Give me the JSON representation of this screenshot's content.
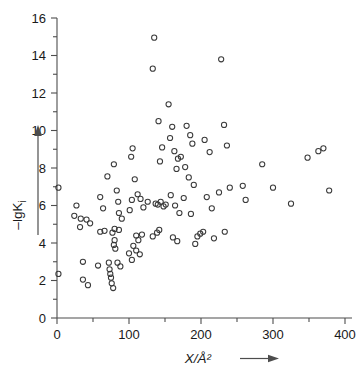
{
  "chart_data": {
    "type": "scatter",
    "title": "",
    "xlabel": "X/Å²",
    "ylabel": "–lgK",
    "ylabel_sub": "i",
    "xlim": [
      0,
      400
    ],
    "ylim": [
      0,
      16
    ],
    "grid": false,
    "legend": null,
    "x_ticks": [
      0,
      100,
      200,
      300,
      400
    ],
    "x_tick_labels": [
      "0",
      "100",
      "200",
      "300",
      "400"
    ],
    "x_minor_step": 50,
    "y_ticks": [
      0,
      2,
      4,
      6,
      8,
      10,
      12,
      14,
      16
    ],
    "y_tick_labels": [
      "0",
      "2",
      "4",
      "6",
      "8",
      "10",
      "12",
      "14",
      "16"
    ],
    "y_minor_step": 1,
    "marker": "open-circle",
    "marker_size_px": 5.2,
    "marker_color": "#3a3a3a",
    "points": [
      [
        2,
        6.95
      ],
      [
        2,
        2.35
      ],
      [
        27,
        6.0
      ],
      [
        24,
        5.45
      ],
      [
        33,
        5.3
      ],
      [
        32,
        4.85
      ],
      [
        41,
        5.25
      ],
      [
        46,
        5.05
      ],
      [
        36,
        3.0
      ],
      [
        36,
        2.05
      ],
      [
        43,
        1.75
      ],
      [
        60,
        6.45
      ],
      [
        64,
        5.85
      ],
      [
        70,
        7.55
      ],
      [
        60,
        4.6
      ],
      [
        66,
        4.65
      ],
      [
        57,
        2.8
      ],
      [
        72,
        2.95
      ],
      [
        73,
        2.6
      ],
      [
        74,
        2.35
      ],
      [
        75,
        2.15
      ],
      [
        76,
        1.85
      ],
      [
        78,
        1.6
      ],
      [
        79,
        8.2
      ],
      [
        83,
        6.8
      ],
      [
        85,
        6.2
      ],
      [
        86,
        5.6
      ],
      [
        90,
        5.3
      ],
      [
        80,
        4.75
      ],
      [
        86,
        4.7
      ],
      [
        77,
        4.55
      ],
      [
        80,
        4.15
      ],
      [
        79,
        3.9
      ],
      [
        81,
        3.7
      ],
      [
        84,
        2.95
      ],
      [
        88,
        2.75
      ],
      [
        105,
        9.05
      ],
      [
        103,
        8.6
      ],
      [
        108,
        7.4
      ],
      [
        104,
        6.3
      ],
      [
        101,
        5.75
      ],
      [
        112,
        6.6
      ],
      [
        116,
        6.35
      ],
      [
        120,
        5.9
      ],
      [
        126,
        6.2
      ],
      [
        110,
        4.4
      ],
      [
        113,
        4.15
      ],
      [
        118,
        4.45
      ],
      [
        106,
        3.85
      ],
      [
        110,
        3.6
      ],
      [
        100,
        3.45
      ],
      [
        104,
        3.1
      ],
      [
        115,
        3.4
      ],
      [
        135,
        14.95
      ],
      [
        133,
        13.3
      ],
      [
        141,
        10.5
      ],
      [
        146,
        9.1
      ],
      [
        143,
        8.35
      ],
      [
        137,
        6.1
      ],
      [
        140,
        6.05
      ],
      [
        144,
        6.2
      ],
      [
        148,
        5.95
      ],
      [
        151,
        6.05
      ],
      [
        133,
        4.35
      ],
      [
        139,
        4.55
      ],
      [
        142,
        4.7
      ],
      [
        155,
        11.4
      ],
      [
        160,
        10.2
      ],
      [
        157,
        9.6
      ],
      [
        163,
        8.9
      ],
      [
        168,
        8.5
      ],
      [
        166,
        7.95
      ],
      [
        172,
        8.6
      ],
      [
        158,
        6.55
      ],
      [
        164,
        6.0
      ],
      [
        170,
        5.6
      ],
      [
        161,
        4.3
      ],
      [
        167,
        4.1
      ],
      [
        180,
        10.25
      ],
      [
        185,
        9.75
      ],
      [
        188,
        9.3
      ],
      [
        178,
        8.05
      ],
      [
        183,
        7.5
      ],
      [
        190,
        7.1
      ],
      [
        176,
        6.4
      ],
      [
        186,
        5.55
      ],
      [
        195,
        4.35
      ],
      [
        199,
        4.5
      ],
      [
        192,
        3.95
      ],
      [
        205,
        9.5
      ],
      [
        212,
        8.85
      ],
      [
        208,
        6.45
      ],
      [
        215,
        5.85
      ],
      [
        203,
        4.6
      ],
      [
        218,
        4.25
      ],
      [
        228,
        13.8
      ],
      [
        232,
        10.3
      ],
      [
        236,
        9.2
      ],
      [
        225,
        6.7
      ],
      [
        240,
        6.95
      ],
      [
        233,
        4.6
      ],
      [
        258,
        7.05
      ],
      [
        262,
        6.3
      ],
      [
        285,
        8.2
      ],
      [
        300,
        6.95
      ],
      [
        325,
        6.1
      ],
      [
        348,
        8.55
      ],
      [
        363,
        8.9
      ],
      [
        370,
        9.05
      ],
      [
        378,
        6.8
      ]
    ]
  },
  "axis_arrows": {
    "x_arrow_present": true,
    "y_arrow_present": true
  }
}
